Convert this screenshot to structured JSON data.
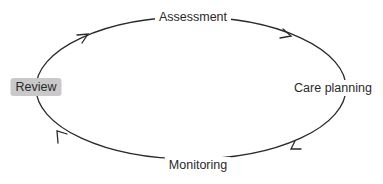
{
  "diagram": {
    "type": "cycle",
    "direction": "clockwise",
    "colors": {
      "line": "#2a2a2a",
      "text": "#2a2a2a",
      "highlight_fill": "#c9c9c9",
      "background": "#ffffff"
    },
    "nodes": [
      {
        "id": "assessment",
        "label": "Assessment",
        "position": "top",
        "highlighted": false
      },
      {
        "id": "care-planning",
        "label": "Care planning",
        "position": "right",
        "highlighted": false
      },
      {
        "id": "monitoring",
        "label": "Monitoring",
        "position": "bottom",
        "highlighted": false
      },
      {
        "id": "review",
        "label": "Review",
        "position": "left",
        "highlighted": true
      }
    ],
    "edges": [
      {
        "from": "review",
        "to": "assessment"
      },
      {
        "from": "assessment",
        "to": "care-planning"
      },
      {
        "from": "care-planning",
        "to": "monitoring"
      },
      {
        "from": "monitoring",
        "to": "review"
      }
    ]
  }
}
